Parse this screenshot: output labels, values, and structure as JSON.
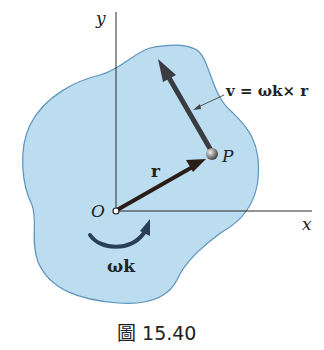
{
  "diagram": {
    "colors": {
      "body_fill": "#bcdcf0",
      "body_stroke": "#5e94bd",
      "axis": "#2a2a2a",
      "vector": "#3a3c42",
      "r_vector": "#2b1d18",
      "point": "#8a8a8a",
      "text": "#222222"
    },
    "axes": {
      "y_label": "y",
      "x_label": "x",
      "origin_label": "O"
    },
    "vectors": {
      "r_label": "r",
      "point_label": "P",
      "velocity_label": "v = ωk× r"
    },
    "rotation": {
      "label": "ωk"
    }
  },
  "caption": {
    "text": "圖 15.40"
  }
}
